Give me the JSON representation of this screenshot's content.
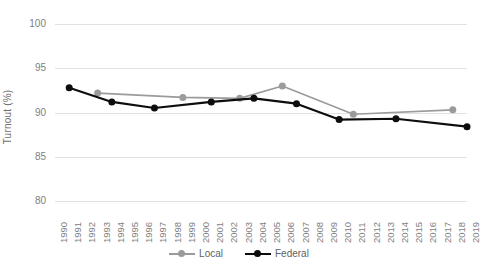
{
  "chart_data": {
    "type": "line",
    "title": "",
    "xlabel": "",
    "ylabel": "Turnout (%)",
    "ylim": [
      80,
      100
    ],
    "ytick_labels": [
      "100",
      "95",
      "90",
      "85",
      "80"
    ],
    "yticks": [
      100,
      95,
      90,
      85,
      80
    ],
    "xlim": [
      1990,
      2019
    ],
    "x": [
      1990,
      1991,
      1992,
      1993,
      1994,
      1995,
      1996,
      1997,
      1998,
      1999,
      2000,
      2001,
      2002,
      2003,
      2004,
      2005,
      2006,
      2007,
      2008,
      2009,
      2010,
      2011,
      2012,
      2013,
      2014,
      2015,
      2016,
      2017,
      2018,
      2019
    ],
    "xtick_labels": [
      "1990",
      "1991",
      "1992",
      "1993",
      "1994",
      "1995",
      "1996",
      "1997",
      "1998",
      "1999",
      "2000",
      "2001",
      "2002",
      "2003",
      "2004",
      "2005",
      "2006",
      "2007",
      "2008",
      "2009",
      "2010",
      "2011",
      "2012",
      "2013",
      "2014",
      "2015",
      "2016",
      "2017",
      "2018",
      "2019"
    ],
    "grid": true,
    "legend_position": "bottom",
    "series": [
      {
        "name": "Local",
        "color": "#9b9b9b",
        "points": [
          {
            "x": 1993,
            "y": 92.2
          },
          {
            "x": 1999,
            "y": 91.7
          },
          {
            "x": 2003,
            "y": 91.6
          },
          {
            "x": 2006,
            "y": 93.0
          },
          {
            "x": 2011,
            "y": 89.8
          },
          {
            "x": 2018,
            "y": 90.3
          }
        ]
      },
      {
        "name": "Federal",
        "color": "#0d0d0d",
        "points": [
          {
            "x": 1991,
            "y": 92.8
          },
          {
            "x": 1994,
            "y": 91.2
          },
          {
            "x": 1997,
            "y": 90.5
          },
          {
            "x": 2001,
            "y": 91.2
          },
          {
            "x": 2004,
            "y": 91.6
          },
          {
            "x": 2007,
            "y": 91.0
          },
          {
            "x": 2010,
            "y": 89.2
          },
          {
            "x": 2014,
            "y": 89.3
          },
          {
            "x": 2019,
            "y": 88.4
          }
        ]
      }
    ]
  },
  "legend": {
    "items": [
      {
        "label": "Local",
        "color": "#9b9b9b"
      },
      {
        "label": "Federal",
        "color": "#0d0d0d"
      }
    ]
  }
}
